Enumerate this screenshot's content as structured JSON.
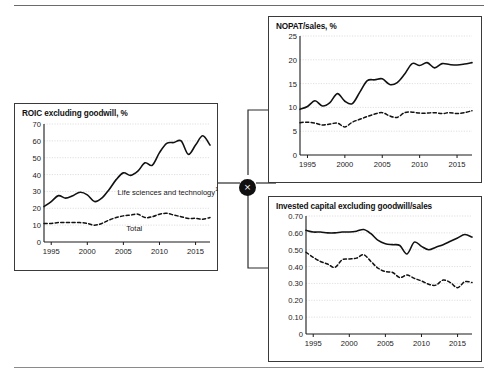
{
  "figure": {
    "operator_symbol": "×",
    "operator_name": "multiply-operator"
  },
  "charts": [
    {
      "id": "roic",
      "title": "ROIC excluding goodwill, %",
      "title_sup": "",
      "series_labels": [
        {
          "text": "Life sciences and technology",
          "sup": "1"
        },
        {
          "text": "Total",
          "sup": ""
        }
      ]
    },
    {
      "id": "nopat",
      "title": "NOPAT/sales, %",
      "title_sup": ""
    },
    {
      "id": "ic",
      "title": "Invested capital excluding goodwill/sales",
      "title_sup": ""
    }
  ],
  "chart_data": [
    {
      "id": "roic",
      "type": "line",
      "title": "ROIC excluding goodwill, %",
      "xlabel": "",
      "ylabel": "",
      "xlim": [
        1994,
        2017
      ],
      "ylim": [
        0,
        70
      ],
      "yticks": [
        0,
        10,
        20,
        30,
        40,
        50,
        60,
        70
      ],
      "ytick_labels": [
        "0",
        "10",
        "20",
        "30",
        "40",
        "50",
        "60",
        "70"
      ],
      "xticks": [
        1995,
        2000,
        2005,
        2010,
        2015
      ],
      "xtick_labels": [
        "1995",
        "2000",
        "2005",
        "2010",
        "2015"
      ],
      "grid": true,
      "legend": "inline-annotation",
      "x": [
        1994,
        1995,
        1996,
        1997,
        1998,
        1999,
        2000,
        2001,
        2002,
        2003,
        2004,
        2005,
        2006,
        2007,
        2008,
        2009,
        2010,
        2011,
        2012,
        2013,
        2014,
        2015,
        2016,
        2017
      ],
      "series": [
        {
          "name": "Life sciences and technology",
          "style": "solid",
          "values": [
            21,
            24,
            27.5,
            26,
            27.5,
            29.5,
            28,
            24,
            26,
            31,
            37,
            41,
            39.5,
            42,
            47,
            45.5,
            53,
            58.5,
            59,
            60,
            52,
            57.5,
            63,
            57.5
          ]
        },
        {
          "name": "Total",
          "style": "dashed",
          "values": [
            11,
            11,
            11.5,
            11.5,
            11.5,
            11.5,
            11,
            10,
            11,
            13,
            14.5,
            15.5,
            16,
            16.5,
            14.5,
            15,
            16.5,
            17,
            16,
            15,
            14,
            14,
            13.5,
            14.5
          ]
        }
      ]
    },
    {
      "id": "nopat",
      "type": "line",
      "title": "NOPAT/sales, %",
      "xlabel": "",
      "ylabel": "",
      "xlim": [
        1994,
        2017
      ],
      "ylim": [
        0,
        25
      ],
      "yticks": [
        0,
        5,
        10,
        15,
        20,
        25
      ],
      "ytick_labels": [
        "0",
        "5",
        "10",
        "15",
        "20",
        "25"
      ],
      "xticks": [
        1995,
        2000,
        2005,
        2010,
        2015
      ],
      "xtick_labels": [
        "1995",
        "2000",
        "2005",
        "2010",
        "2015"
      ],
      "grid": true,
      "x": [
        1994,
        1995,
        1996,
        1997,
        1998,
        1999,
        2000,
        2001,
        2002,
        2003,
        2004,
        2005,
        2006,
        2007,
        2008,
        2009,
        2010,
        2011,
        2012,
        2013,
        2014,
        2015,
        2016,
        2017
      ],
      "series": [
        {
          "name": "Life sciences and technology",
          "style": "solid",
          "values": [
            9.6,
            10.2,
            11.4,
            10.3,
            11.0,
            12.9,
            11.3,
            10.8,
            13.2,
            15.6,
            15.8,
            16.0,
            14.8,
            15.2,
            17.0,
            19.2,
            18.8,
            19.4,
            18.3,
            19.2,
            19.0,
            18.9,
            19.1,
            19.4
          ]
        },
        {
          "name": "Total",
          "style": "dashed",
          "values": [
            6.8,
            6.9,
            6.7,
            6.3,
            6.5,
            6.7,
            5.9,
            6.9,
            7.5,
            8.1,
            8.6,
            8.9,
            8.2,
            7.9,
            8.9,
            9.0,
            8.8,
            8.8,
            8.9,
            8.7,
            8.9,
            8.7,
            8.9,
            9.3
          ]
        }
      ]
    },
    {
      "id": "ic",
      "type": "line",
      "title": "Invested capital excluding goodwill/sales",
      "xlabel": "",
      "ylabel": "",
      "xlim": [
        1994,
        2017
      ],
      "ylim": [
        0,
        0.7
      ],
      "yticks": [
        0,
        0.1,
        0.2,
        0.3,
        0.4,
        0.5,
        0.6,
        0.7
      ],
      "ytick_labels": [
        "0",
        "0.10",
        "0.20",
        "0.30",
        "0.40",
        "0.50",
        "0.60",
        "0.70"
      ],
      "xticks": [
        1995,
        2000,
        2005,
        2010,
        2015
      ],
      "xtick_labels": [
        "1995",
        "2000",
        "2005",
        "2010",
        "2015"
      ],
      "grid": true,
      "x": [
        1994,
        1995,
        1996,
        1997,
        1998,
        1999,
        2000,
        2001,
        2002,
        2003,
        2004,
        2005,
        2006,
        2007,
        2008,
        2009,
        2010,
        2011,
        2012,
        2013,
        2014,
        2015,
        2016,
        2017
      ],
      "series": [
        {
          "name": "Life sciences and technology",
          "style": "solid",
          "values": [
            0.615,
            0.605,
            0.605,
            0.6,
            0.6,
            0.605,
            0.605,
            0.61,
            0.62,
            0.595,
            0.555,
            0.535,
            0.53,
            0.525,
            0.475,
            0.545,
            0.52,
            0.5,
            0.515,
            0.53,
            0.55,
            0.57,
            0.59,
            0.575
          ]
        },
        {
          "name": "Total",
          "style": "dashed",
          "values": [
            0.485,
            0.455,
            0.43,
            0.415,
            0.395,
            0.44,
            0.445,
            0.45,
            0.47,
            0.43,
            0.39,
            0.37,
            0.365,
            0.335,
            0.35,
            0.33,
            0.315,
            0.295,
            0.29,
            0.32,
            0.305,
            0.275,
            0.31,
            0.305
          ]
        }
      ]
    }
  ]
}
